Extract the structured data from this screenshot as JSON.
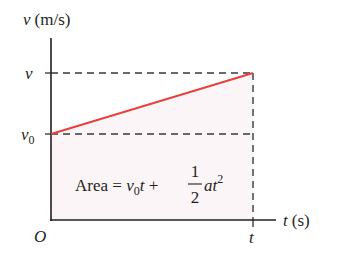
{
  "diagram": {
    "type": "velocity-time graph",
    "y_axis": {
      "variable": "v",
      "unit": "(m/s)"
    },
    "x_axis": {
      "variable": "t",
      "unit": "(s)"
    },
    "origin_label": "O",
    "ticks": {
      "y": [
        {
          "label": "v"
        },
        {
          "label": "v",
          "subscript": "0"
        }
      ],
      "x": [
        {
          "label": "t"
        }
      ]
    },
    "formula": {
      "prefix": "Area = ",
      "v": "v",
      "v_sub": "0",
      "t1": "t",
      "plus": " + ",
      "numerator": "1",
      "denominator": "2",
      "a": "a",
      "t2": "t",
      "exponent": "2"
    },
    "colors": {
      "line": "#e8413c",
      "axis": "#231f20",
      "dash": "#3a3a3a",
      "shade": "#fbf5f7"
    }
  }
}
